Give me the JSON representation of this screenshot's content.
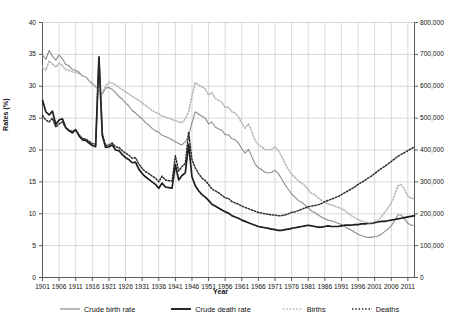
{
  "chart_data": {
    "type": "line",
    "title": "",
    "xlabel": "Year",
    "ylabel": "Rates (%)",
    "ylabel_right": "",
    "grid": true,
    "legend_position": "bottom",
    "xlim": [
      1901,
      2013
    ],
    "ylim": [
      0,
      40
    ],
    "ylim_right": [
      0,
      800000
    ],
    "x_ticks": [
      1901,
      1906,
      1911,
      1916,
      1921,
      1926,
      1931,
      1936,
      1941,
      1946,
      1951,
      1956,
      1961,
      1966,
      1971,
      1976,
      1981,
      1986,
      1991,
      1996,
      2001,
      2006,
      2011
    ],
    "y_ticks_left": [
      0,
      5,
      10,
      15,
      20,
      25,
      30,
      35,
      40
    ],
    "y_ticks_right": [
      "0",
      "100,000",
      "200,000",
      "300,000",
      "400,000",
      "500,000",
      "600,000",
      "700,000",
      "800,000"
    ],
    "series": [
      {
        "name": "Crude birth rate",
        "axis": "left",
        "color": "#8c8c8c",
        "style": "solid",
        "width": 1.1,
        "x": [
          1901,
          1902,
          1903,
          1904,
          1905,
          1906,
          1907,
          1908,
          1909,
          1910,
          1911,
          1912,
          1913,
          1914,
          1915,
          1916,
          1917,
          1918,
          1919,
          1920,
          1921,
          1922,
          1923,
          1924,
          1925,
          1926,
          1927,
          1928,
          1929,
          1930,
          1931,
          1932,
          1933,
          1934,
          1935,
          1936,
          1937,
          1938,
          1939,
          1940,
          1941,
          1942,
          1943,
          1944,
          1945,
          1946,
          1947,
          1948,
          1949,
          1950,
          1951,
          1952,
          1953,
          1954,
          1955,
          1956,
          1957,
          1958,
          1959,
          1960,
          1961,
          1962,
          1963,
          1964,
          1965,
          1966,
          1967,
          1968,
          1969,
          1970,
          1971,
          1972,
          1973,
          1974,
          1975,
          1976,
          1977,
          1978,
          1979,
          1980,
          1981,
          1982,
          1983,
          1984,
          1985,
          1986,
          1987,
          1988,
          1989,
          1990,
          1991,
          1992,
          1993,
          1994,
          1995,
          1996,
          1997,
          1998,
          1999,
          2000,
          2001,
          2002,
          2003,
          2004,
          2005,
          2006,
          2007,
          2008,
          2009,
          2010,
          2011,
          2012,
          2013
        ],
        "y": [
          34.9,
          34.2,
          35.6,
          34.7,
          34.1,
          34.9,
          34.3,
          33.4,
          33.2,
          32.6,
          32.5,
          32.2,
          31.6,
          31.5,
          30.8,
          30.4,
          29.9,
          29.4,
          28.8,
          29.7,
          29.8,
          29.5,
          29.0,
          28.4,
          28.0,
          27.4,
          26.9,
          26.2,
          25.8,
          25.3,
          24.9,
          24.3,
          23.9,
          23.4,
          23.0,
          22.8,
          22.3,
          22.1,
          21.9,
          21.6,
          21.3,
          21.0,
          20.8,
          21.3,
          22.2,
          24.3,
          26.0,
          25.6,
          25.3,
          25.0,
          24.1,
          24.4,
          23.6,
          23.3,
          23.1,
          22.4,
          22.4,
          21.8,
          21.6,
          21.1,
          20.2,
          19.5,
          20.1,
          19.0,
          17.8,
          17.2,
          16.9,
          16.5,
          16.4,
          16.5,
          16.8,
          16.3,
          15.5,
          14.6,
          13.8,
          13.1,
          12.6,
          12.1,
          11.8,
          11.4,
          10.9,
          10.4,
          10.2,
          9.8,
          9.5,
          9.2,
          9.0,
          8.9,
          8.7,
          8.5,
          8.3,
          8.0,
          7.7,
          7.4,
          7.1,
          6.8,
          6.6,
          6.4,
          6.3,
          6.3,
          6.4,
          6.5,
          6.8,
          7.2,
          7.6,
          8.1,
          8.9,
          9.8,
          9.8,
          9.2,
          8.5,
          8.2,
          8.2
        ]
      },
      {
        "name": "Crude death rate",
        "axis": "left",
        "color": "#1c1c1c",
        "style": "solid",
        "width": 1.7,
        "x": [
          1901,
          1902,
          1903,
          1904,
          1905,
          1906,
          1907,
          1908,
          1909,
          1910,
          1911,
          1912,
          1913,
          1914,
          1915,
          1916,
          1917,
          1918,
          1919,
          1920,
          1921,
          1922,
          1923,
          1924,
          1925,
          1926,
          1927,
          1928,
          1929,
          1930,
          1931,
          1932,
          1933,
          1934,
          1935,
          1936,
          1937,
          1938,
          1939,
          1940,
          1941,
          1942,
          1943,
          1944,
          1945,
          1946,
          1947,
          1948,
          1949,
          1950,
          1951,
          1952,
          1953,
          1954,
          1955,
          1956,
          1957,
          1958,
          1959,
          1960,
          1961,
          1962,
          1963,
          1964,
          1965,
          1966,
          1967,
          1968,
          1969,
          1970,
          1971,
          1972,
          1973,
          1974,
          1975,
          1976,
          1977,
          1978,
          1979,
          1980,
          1981,
          1982,
          1983,
          1984,
          1985,
          1986,
          1987,
          1988,
          1989,
          1990,
          1991,
          1992,
          1993,
          1994,
          1995,
          1996,
          1997,
          1998,
          1999,
          2000,
          2001,
          2002,
          2003,
          2004,
          2005,
          2006,
          2007,
          2008,
          2009,
          2010,
          2011,
          2012,
          2013
        ],
        "y": [
          27.8,
          26.0,
          25.5,
          26.1,
          24.0,
          24.7,
          24.9,
          23.5,
          23.0,
          22.7,
          23.2,
          22.2,
          21.6,
          21.5,
          21.1,
          20.7,
          20.5,
          34.6,
          22.3,
          20.4,
          20.5,
          20.8,
          20.0,
          19.9,
          19.3,
          18.8,
          18.5,
          18.0,
          18.1,
          17.0,
          16.3,
          15.8,
          15.4,
          15.0,
          14.6,
          14.0,
          14.8,
          14.2,
          14.1,
          14.0,
          17.7,
          15.3,
          16.0,
          16.4,
          20.9,
          15.8,
          14.4,
          13.6,
          13.0,
          12.6,
          12.1,
          11.5,
          11.2,
          10.9,
          10.6,
          10.3,
          10.1,
          9.7,
          9.5,
          9.3,
          9.0,
          8.8,
          8.6,
          8.4,
          8.2,
          8.0,
          7.9,
          7.8,
          7.7,
          7.6,
          7.5,
          7.4,
          7.4,
          7.5,
          7.6,
          7.7,
          7.8,
          7.9,
          8.0,
          8.1,
          8.2,
          8.1,
          8.0,
          7.9,
          7.9,
          8.0,
          8.1,
          8.0,
          8.0,
          8.0,
          8.1,
          8.2,
          8.2,
          8.2,
          8.3,
          8.3,
          8.4,
          8.4,
          8.5,
          8.5,
          8.6,
          8.7,
          8.8,
          8.8,
          8.9,
          9.0,
          9.1,
          9.2,
          9.3,
          9.4,
          9.5,
          9.6,
          9.7
        ]
      },
      {
        "name": "Births",
        "axis": "right",
        "color": "#b5b5b5",
        "style": "dotted",
        "width": 1.5,
        "x": [
          1901,
          1902,
          1903,
          1904,
          1905,
          1906,
          1907,
          1908,
          1909,
          1910,
          1911,
          1912,
          1913,
          1914,
          1915,
          1916,
          1917,
          1918,
          1919,
          1920,
          1921,
          1922,
          1923,
          1924,
          1925,
          1926,
          1927,
          1928,
          1929,
          1930,
          1931,
          1932,
          1933,
          1934,
          1935,
          1936,
          1937,
          1938,
          1939,
          1940,
          1941,
          1942,
          1943,
          1944,
          1945,
          1946,
          1947,
          1948,
          1949,
          1950,
          1951,
          1952,
          1953,
          1954,
          1955,
          1956,
          1957,
          1958,
          1959,
          1960,
          1961,
          1962,
          1963,
          1964,
          1965,
          1966,
          1967,
          1968,
          1969,
          1970,
          1971,
          1972,
          1973,
          1974,
          1975,
          1976,
          1977,
          1978,
          1979,
          1980,
          1981,
          1982,
          1983,
          1984,
          1985,
          1986,
          1987,
          1988,
          1989,
          1990,
          1991,
          1992,
          1993,
          1994,
          1995,
          1996,
          1997,
          1998,
          1999,
          2000,
          2001,
          2002,
          2003,
          2004,
          2005,
          2006,
          2007,
          2008,
          2009,
          2010,
          2011,
          2012,
          2013
        ],
        "y": [
          660000,
          650000,
          680000,
          670000,
          660000,
          672000,
          664000,
          652000,
          650000,
          645000,
          644000,
          640000,
          632000,
          630000,
          618000,
          610000,
          600000,
          590000,
          580000,
          600000,
          612000,
          610000,
          604000,
          596000,
          590000,
          582000,
          576000,
          568000,
          562000,
          556000,
          548000,
          540000,
          532000,
          524000,
          518000,
          514000,
          506000,
          504000,
          500000,
          496000,
          492000,
          488000,
          486000,
          498000,
          520000,
          570000,
          612000,
          604000,
          598000,
          592000,
          572000,
          580000,
          562000,
          556000,
          550000,
          534000,
          534000,
          520000,
          516000,
          504000,
          484000,
          468000,
          482000,
          458000,
          430000,
          416000,
          410000,
          402000,
          400000,
          402000,
          410000,
          398000,
          380000,
          358000,
          340000,
          324000,
          314000,
          304000,
          296000,
          288000,
          276000,
          264000,
          260000,
          250000,
          242000,
          236000,
          230000,
          228000,
          224000,
          220000,
          216000,
          210000,
          202000,
          194000,
          188000,
          182000,
          178000,
          174000,
          172000,
          172000,
          176000,
          180000,
          190000,
          204000,
          218000,
          234000,
          258000,
          288000,
          292000,
          276000,
          256000,
          248000,
          248000
        ]
      },
      {
        "name": "Deaths",
        "axis": "right",
        "color": "#2a2a2a",
        "style": "dotted",
        "width": 1.5,
        "x": [
          1901,
          1902,
          1903,
          1904,
          1905,
          1906,
          1907,
          1908,
          1909,
          1910,
          1911,
          1912,
          1913,
          1914,
          1915,
          1916,
          1917,
          1918,
          1919,
          1920,
          1921,
          1922,
          1923,
          1924,
          1925,
          1926,
          1927,
          1928,
          1929,
          1930,
          1931,
          1932,
          1933,
          1934,
          1935,
          1936,
          1937,
          1938,
          1939,
          1940,
          1941,
          1942,
          1943,
          1944,
          1945,
          1946,
          1947,
          1948,
          1949,
          1950,
          1951,
          1952,
          1953,
          1954,
          1955,
          1956,
          1957,
          1958,
          1959,
          1960,
          1961,
          1962,
          1963,
          1964,
          1965,
          1966,
          1967,
          1968,
          1969,
          1970,
          1971,
          1972,
          1973,
          1974,
          1975,
          1976,
          1977,
          1978,
          1979,
          1980,
          1981,
          1982,
          1983,
          1984,
          1985,
          1986,
          1987,
          1988,
          1989,
          1990,
          1991,
          1992,
          1993,
          1994,
          1995,
          1996,
          1997,
          1998,
          1999,
          2000,
          2001,
          2002,
          2003,
          2004,
          2005,
          2006,
          2007,
          2008,
          2009,
          2010,
          2011,
          2012,
          2013
        ],
        "y": [
          508000,
          494000,
          488000,
          500000,
          472000,
          482000,
          488000,
          470000,
          462000,
          458000,
          464000,
          448000,
          436000,
          434000,
          428000,
          420000,
          418000,
          690000,
          452000,
          414000,
          416000,
          422000,
          410000,
          408000,
          398000,
          390000,
          384000,
          374000,
          376000,
          356000,
          342000,
          332000,
          326000,
          318000,
          312000,
          300000,
          318000,
          306000,
          304000,
          302000,
          382000,
          334000,
          348000,
          358000,
          456000,
          370000,
          344000,
          326000,
          312000,
          304000,
          292000,
          278000,
          272000,
          266000,
          258000,
          250000,
          248000,
          238000,
          234000,
          230000,
          224000,
          220000,
          216000,
          212000,
          208000,
          204000,
          202000,
          200000,
          198000,
          196000,
          196000,
          194000,
          194000,
          196000,
          200000,
          204000,
          206000,
          210000,
          214000,
          218000,
          222000,
          224000,
          226000,
          228000,
          232000,
          238000,
          242000,
          246000,
          250000,
          254000,
          260000,
          266000,
          272000,
          278000,
          284000,
          292000,
          298000,
          304000,
          312000,
          318000,
          326000,
          334000,
          342000,
          348000,
          356000,
          364000,
          372000,
          380000,
          386000,
          392000,
          398000,
          404000,
          410000
        ]
      }
    ]
  },
  "legend": {
    "items": [
      {
        "label": "Crude birth rate",
        "color": "#8c8c8c",
        "style": "solid"
      },
      {
        "label": "Crude death rate",
        "color": "#1c1c1c",
        "style": "solid"
      },
      {
        "label": "Births",
        "color": "#b5b5b5",
        "style": "dotted"
      },
      {
        "label": "Deaths",
        "color": "#2a2a2a",
        "style": "dotted"
      }
    ]
  }
}
